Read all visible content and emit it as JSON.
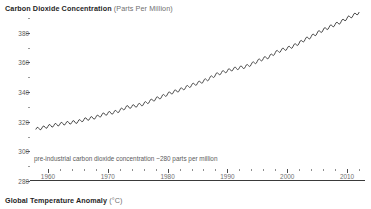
{
  "charts": {
    "co2": {
      "title": "Carbon Dioxide Concentration",
      "unit": "(Parts Per Million)",
      "annotation": "pre-industrial carbon dioxide concentration ~280 parts per million"
    },
    "temperature": {
      "title": "Global Temperature Anomaly",
      "unit": "(°C)"
    }
  },
  "chart_data": {
    "type": "line",
    "title": "Carbon Dioxide Concentration (Parts Per Million)",
    "xlabel": "",
    "ylabel": "Parts Per Million",
    "xlim": [
      1957,
      2013
    ],
    "ylim": [
      280,
      390
    ],
    "grid": false,
    "legend": null,
    "annotations": [
      {
        "text": "pre-industrial carbon dioxide concentration ~280 parts per million",
        "x": 1959,
        "y": 288
      }
    ],
    "yticks": [
      280,
      300,
      320,
      340,
      360,
      380
    ],
    "ytick_labels": [
      "280",
      "300",
      "320",
      "340",
      "360",
      "380"
    ],
    "yticks_minor": [
      290,
      310,
      330,
      350,
      370,
      390
    ],
    "xticks": [
      1960,
      1970,
      1980,
      1990,
      2000,
      2010
    ],
    "xtick_labels": [
      "1960",
      "1970",
      "1980",
      "1990",
      "2000",
      "2010"
    ],
    "xticks_minor": [
      1962,
      1964,
      1966,
      1968,
      1972,
      1974,
      1976,
      1978,
      1982,
      1984,
      1986,
      1988,
      1992,
      1994,
      1996,
      1998,
      2002,
      2004,
      2006,
      2008,
      2012
    ],
    "series": [
      {
        "name": "Atmospheric CO2 (Mauna Loa)",
        "color": "#4a4a4a",
        "x": [
          1958,
          1959,
          1960,
          1961,
          1962,
          1963,
          1964,
          1965,
          1966,
          1967,
          1968,
          1969,
          1970,
          1971,
          1972,
          1973,
          1974,
          1975,
          1976,
          1977,
          1978,
          1979,
          1980,
          1981,
          1982,
          1983,
          1984,
          1985,
          1986,
          1987,
          1988,
          1989,
          1990,
          1991,
          1992,
          1993,
          1994,
          1995,
          1996,
          1997,
          1998,
          1999,
          2000,
          2001,
          2002,
          2003,
          2004,
          2005,
          2006,
          2007,
          2008,
          2009,
          2010,
          2011,
          2012
        ],
        "y": [
          315.0,
          315.8,
          316.9,
          317.6,
          318.4,
          319.0,
          319.6,
          320.0,
          321.4,
          322.2,
          323.0,
          324.6,
          325.7,
          326.3,
          327.5,
          329.7,
          330.2,
          331.1,
          332.0,
          333.8,
          335.4,
          336.8,
          338.7,
          340.1,
          341.4,
          343.0,
          344.6,
          346.0,
          347.4,
          349.2,
          351.6,
          353.1,
          354.4,
          355.6,
          356.4,
          357.1,
          358.8,
          360.8,
          362.6,
          363.8,
          366.6,
          368.3,
          369.5,
          371.0,
          373.1,
          375.6,
          377.4,
          379.8,
          381.9,
          383.8,
          385.6,
          387.4,
          389.9,
          391.6,
          393.8
        ]
      }
    ]
  }
}
